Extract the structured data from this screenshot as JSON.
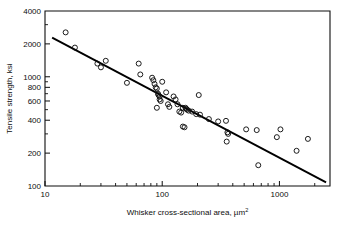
{
  "figure": {
    "name": "whisker-strength-vs-area-plot",
    "background": "#ffffff",
    "ink_color": "#0d0d0d"
  },
  "chart_data": {
    "type": "scatter",
    "title": "",
    "subtitle": "",
    "xlabel": "Whisker cross-sectional area, µm²",
    "xlabel_text": "Whisker cross-sectional area, ",
    "xlabel_unit_base": "µm",
    "xlabel_unit_exp": "2",
    "ylabel": "Tensile strength, ksi",
    "xscale": "log",
    "yscale": "log",
    "xlim": [
      10,
      2700
    ],
    "ylim": [
      100,
      4000
    ],
    "grid": false,
    "legend": null,
    "xticks": [
      10,
      100,
      1000
    ],
    "xtick_labels": [
      "10",
      "100",
      "1000"
    ],
    "xminor_ticks": [
      20,
      30,
      40,
      50,
      60,
      70,
      80,
      90,
      200,
      300,
      400,
      500,
      600,
      700,
      800,
      900,
      2000
    ],
    "yticks": [
      100,
      200,
      400,
      600,
      800,
      1000,
      2000,
      4000
    ],
    "ytick_labels": [
      "100",
      "200",
      "400",
      "600",
      "800",
      "1000",
      "2000",
      "4000"
    ],
    "yminor_ticks": [
      300,
      500,
      700,
      900,
      3000
    ],
    "marker": "open-circle",
    "marker_color": "#111111",
    "points": [
      {
        "x": 15,
        "y": 2550
      },
      {
        "x": 18,
        "y": 1850
      },
      {
        "x": 28,
        "y": 1320
      },
      {
        "x": 30,
        "y": 1220
      },
      {
        "x": 33,
        "y": 1400
      },
      {
        "x": 50,
        "y": 880
      },
      {
        "x": 63,
        "y": 1320
      },
      {
        "x": 65,
        "y": 1050
      },
      {
        "x": 82,
        "y": 980
      },
      {
        "x": 84,
        "y": 930
      },
      {
        "x": 86,
        "y": 860
      },
      {
        "x": 88,
        "y": 800
      },
      {
        "x": 90,
        "y": 780
      },
      {
        "x": 92,
        "y": 700
      },
      {
        "x": 93,
        "y": 680
      },
      {
        "x": 95,
        "y": 660
      },
      {
        "x": 95,
        "y": 620
      },
      {
        "x": 97,
        "y": 600
      },
      {
        "x": 90,
        "y": 520
      },
      {
        "x": 100,
        "y": 900
      },
      {
        "x": 108,
        "y": 720
      },
      {
        "x": 112,
        "y": 560
      },
      {
        "x": 115,
        "y": 530
      },
      {
        "x": 125,
        "y": 660
      },
      {
        "x": 130,
        "y": 620
      },
      {
        "x": 135,
        "y": 560
      },
      {
        "x": 140,
        "y": 480
      },
      {
        "x": 145,
        "y": 470
      },
      {
        "x": 150,
        "y": 520
      },
      {
        "x": 158,
        "y": 520
      },
      {
        "x": 160,
        "y": 510
      },
      {
        "x": 163,
        "y": 500
      },
      {
        "x": 168,
        "y": 490
      },
      {
        "x": 150,
        "y": 350
      },
      {
        "x": 155,
        "y": 345
      },
      {
        "x": 180,
        "y": 480
      },
      {
        "x": 195,
        "y": 455
      },
      {
        "x": 205,
        "y": 680
      },
      {
        "x": 210,
        "y": 450
      },
      {
        "x": 250,
        "y": 410
      },
      {
        "x": 300,
        "y": 390
      },
      {
        "x": 350,
        "y": 395
      },
      {
        "x": 360,
        "y": 310
      },
      {
        "x": 365,
        "y": 300
      },
      {
        "x": 355,
        "y": 255
      },
      {
        "x": 520,
        "y": 330
      },
      {
        "x": 640,
        "y": 325
      },
      {
        "x": 660,
        "y": 155
      },
      {
        "x": 950,
        "y": 280
      },
      {
        "x": 1020,
        "y": 330
      },
      {
        "x": 1400,
        "y": 210
      },
      {
        "x": 1750,
        "y": 270
      }
    ],
    "trendline": {
      "type": "linear-on-log-log",
      "color": "#000000",
      "x_start": 11.5,
      "y_start": 2280,
      "x_end": 2500,
      "y_end": 108
    }
  }
}
